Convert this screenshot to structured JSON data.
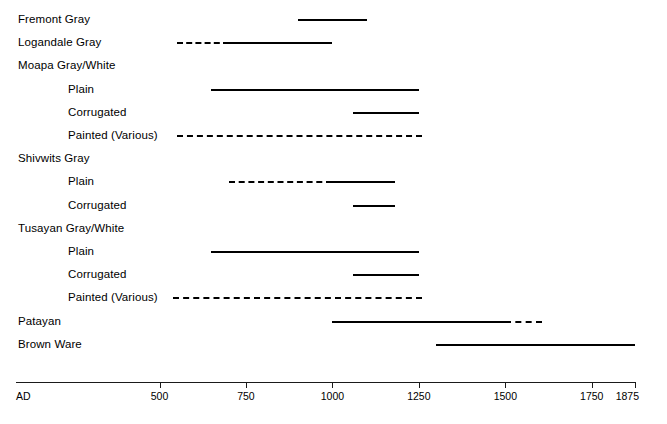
{
  "chart_data": {
    "type": "bar",
    "title": "",
    "subtitle": "",
    "xlabel": "AD",
    "ylabel": "",
    "xlim": [
      85,
      1875
    ],
    "grid": false,
    "legend": null,
    "axis": {
      "origin_label": "AD",
      "ticks": [
        500,
        750,
        1000,
        1250,
        1500,
        1750,
        1875
      ],
      "tick_labels": [
        "500",
        "750",
        "1000",
        "1250",
        "1500",
        "1750",
        "1875"
      ]
    },
    "categories": [
      "Fremont Gray",
      "Logandale Gray",
      "Moapa Gray/White",
      "Plain",
      "Corrugated",
      "Painted (Various)",
      "Shivwits Gray",
      "Plain",
      "Corrugated",
      "Tusayan Gray/White",
      "Plain",
      "Corrugated",
      "Painted (Various)",
      "Patayan",
      "Brown Ware"
    ],
    "rows": [
      {
        "label": "Fremont Gray",
        "indent": 0,
        "segments": [
          {
            "style": "solid",
            "start": 900,
            "end": 1100
          }
        ]
      },
      {
        "label": "Logandale Gray",
        "indent": 0,
        "segments": [
          {
            "style": "dashed",
            "start": 550,
            "end": 700
          },
          {
            "style": "solid",
            "start": 700,
            "end": 1000
          }
        ]
      },
      {
        "label": "Moapa Gray/White",
        "indent": 0,
        "segments": []
      },
      {
        "label": "Plain",
        "indent": 1,
        "segments": [
          {
            "style": "solid",
            "start": 650,
            "end": 1250
          }
        ]
      },
      {
        "label": "Corrugated",
        "indent": 1,
        "segments": [
          {
            "style": "solid",
            "start": 1060,
            "end": 1250
          }
        ]
      },
      {
        "label": "Painted (Various)",
        "indent": 1,
        "segments": [
          {
            "style": "dashed",
            "start": 550,
            "end": 1260
          }
        ]
      },
      {
        "label": "Shivwits Gray",
        "indent": 0,
        "segments": []
      },
      {
        "label": "Plain",
        "indent": 1,
        "segments": [
          {
            "style": "dashed",
            "start": 700,
            "end": 1000
          },
          {
            "style": "solid",
            "start": 1000,
            "end": 1180
          }
        ]
      },
      {
        "label": "Corrugated",
        "indent": 1,
        "segments": [
          {
            "style": "solid",
            "start": 1060,
            "end": 1180
          }
        ]
      },
      {
        "label": "Tusayan Gray/White",
        "indent": 0,
        "segments": []
      },
      {
        "label": "Plain",
        "indent": 1,
        "segments": [
          {
            "style": "solid",
            "start": 650,
            "end": 1250
          }
        ]
      },
      {
        "label": "Corrugated",
        "indent": 1,
        "segments": [
          {
            "style": "solid",
            "start": 1060,
            "end": 1250
          }
        ]
      },
      {
        "label": "Painted (Various)",
        "indent": 1,
        "segments": [
          {
            "style": "dashed",
            "start": 540,
            "end": 1260
          }
        ]
      },
      {
        "label": "Patayan",
        "indent": 0,
        "segments": [
          {
            "style": "solid",
            "start": 1000,
            "end": 1500
          },
          {
            "style": "dashed",
            "start": 1500,
            "end": 1605
          }
        ]
      },
      {
        "label": "Brown Ware",
        "indent": 0,
        "segments": [
          {
            "style": "solid",
            "start": 1300,
            "end": 1875
          }
        ]
      }
    ]
  },
  "caption": ""
}
